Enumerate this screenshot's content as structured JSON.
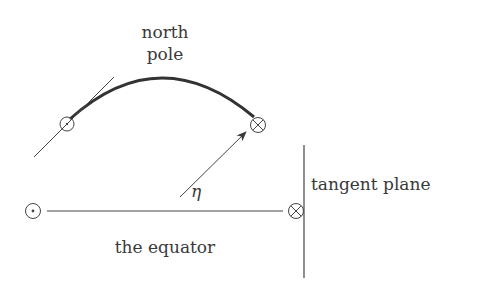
{
  "diagram": {
    "labels": {
      "north_pole_line1": "north",
      "north_pole_line2": "pole",
      "tangent_plane": "tangent plane",
      "equator": "the equator",
      "angle": "η"
    },
    "symbols": {
      "out_of_page": "circle-dot",
      "into_page": "circle-cross"
    },
    "colors": {
      "ink": "#3a3a3a",
      "background": "#ffffff"
    }
  }
}
